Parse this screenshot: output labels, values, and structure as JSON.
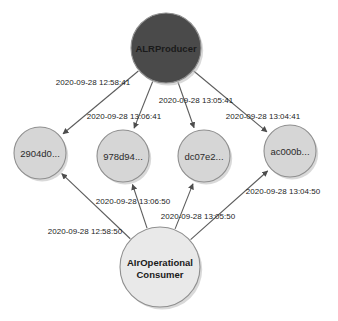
{
  "diagram": {
    "type": "directed-graph",
    "title": "",
    "background_color": "#ffffff",
    "edge_color": "#5c5c5c",
    "nodes": [
      {
        "id": "producer",
        "label": "ALRProducer",
        "role": "producer",
        "fill": "#4a4a4a",
        "text_color": "#ffffff",
        "cx": 166,
        "cy": 48,
        "r": 35
      },
      {
        "id": "n1",
        "label": "2904d0...",
        "role": "record",
        "fill": "#d6d6d6",
        "text_color": "#2b2b2b",
        "cx": 40,
        "cy": 153,
        "r": 26
      },
      {
        "id": "n2",
        "label": "978d94...",
        "role": "record",
        "fill": "#d6d6d6",
        "text_color": "#2b2b2b",
        "cx": 123,
        "cy": 156,
        "r": 26
      },
      {
        "id": "n3",
        "label": "dc07e2...",
        "role": "record",
        "fill": "#d6d6d6",
        "text_color": "#2b2b2b",
        "cx": 204,
        "cy": 156,
        "r": 26
      },
      {
        "id": "n4",
        "label": "ac000b...",
        "role": "record",
        "fill": "#d6d6d6",
        "text_color": "#2b2b2b",
        "cx": 290,
        "cy": 151,
        "r": 26
      },
      {
        "id": "consumer",
        "label_line1": "AIrOperational",
        "label_line2": "Consumer",
        "role": "consumer",
        "fill": "#e9e9e9",
        "text_color": "#1a1a1a",
        "cx": 160,
        "cy": 267,
        "r": 40
      }
    ],
    "edges": [
      {
        "id": "e1",
        "from": "producer",
        "to": "n1",
        "label": "2020-09-28 12:58:41",
        "label_x": 93,
        "label_y": 85
      },
      {
        "id": "e2",
        "from": "producer",
        "to": "n2",
        "label": "2020-09-28 13:06:41",
        "label_x": 124,
        "label_y": 119
      },
      {
        "id": "e3",
        "from": "producer",
        "to": "n3",
        "label": "2020-09-28 13:05:41",
        "label_x": 196,
        "label_y": 103
      },
      {
        "id": "e4",
        "from": "producer",
        "to": "n4",
        "label": "2020-09-28 13:04:41",
        "label_x": 263,
        "label_y": 119
      },
      {
        "id": "e5",
        "from": "consumer",
        "to": "n1",
        "label": "2020-09-28 12:58:50",
        "label_x": 85,
        "label_y": 234
      },
      {
        "id": "e6",
        "from": "consumer",
        "to": "n2",
        "label": "2020-09-28 13:06:50",
        "label_x": 133,
        "label_y": 204
      },
      {
        "id": "e7",
        "from": "consumer",
        "to": "n3",
        "label": "2020-09-28 13:05:50",
        "label_x": 198,
        "label_y": 219
      },
      {
        "id": "e8",
        "from": "consumer",
        "to": "n4",
        "label": "2020-09-28 13:04:50",
        "label_x": 283,
        "label_y": 194
      }
    ]
  }
}
